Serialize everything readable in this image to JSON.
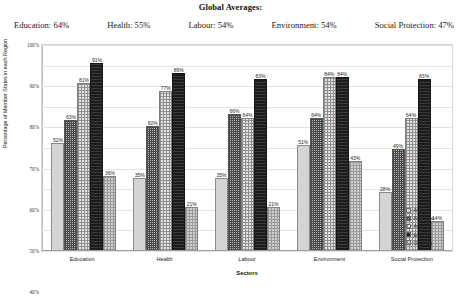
{
  "header": {
    "title": "Global Averages:",
    "averages": [
      {
        "label": "Education",
        "value": "64%",
        "text": "Education: 64%"
      },
      {
        "label": "Health",
        "value": "55%",
        "text": "Health: 55%"
      },
      {
        "label": "Labour",
        "value": "54%",
        "text": "Labour: 54%"
      },
      {
        "label": "Environment",
        "value": "54%",
        "text": "Environment: 54%"
      },
      {
        "label": "Social Protection",
        "value": "47%",
        "text": "Social Protection: 47%"
      }
    ]
  },
  "chart_data": {
    "type": "bar",
    "title": "Global Averages:",
    "xlabel": "Sectors",
    "ylabel": "Percentage of Member States in each Region",
    "ylim": [
      0,
      100
    ],
    "ytick_labels": [
      "100%",
      "90%",
      "80%",
      "70%",
      "60%",
      "50%",
      "40%",
      "30%",
      "20%",
      "10%",
      "0%"
    ],
    "ytick_values": [
      100,
      90,
      80,
      70,
      60,
      50,
      40,
      30,
      20,
      10,
      0
    ],
    "grid": true,
    "legend_position": "right",
    "categories": [
      "Education",
      "Health",
      "Labour",
      "Environment",
      "Social Protection"
    ],
    "series": [
      {
        "name": "Africa",
        "values": [
          52,
          35,
          35,
          51,
          28
        ],
        "labels": [
          "52%",
          "35%",
          "35%",
          "51%",
          "28%"
        ]
      },
      {
        "name": "Americas",
        "values": [
          63,
          60,
          66,
          64,
          49
        ],
        "labels": [
          "63%",
          "60%",
          "66%",
          "64%",
          "49%"
        ]
      },
      {
        "name": "Asia",
        "values": [
          81,
          77,
          64,
          84,
          64
        ],
        "labels": [
          "81%",
          "77%",
          "64%",
          "84%",
          "64%"
        ]
      },
      {
        "name": "Europe",
        "values": [
          91,
          86,
          83,
          84,
          83
        ],
        "labels": [
          "91%",
          "86%",
          "83%",
          "84%",
          "83%"
        ]
      },
      {
        "name": "Oceania",
        "values": [
          36,
          21,
          21,
          43,
          14
        ],
        "labels": [
          "36%",
          "21%",
          "21%",
          "43%",
          "14%"
        ]
      }
    ],
    "legend_entries": [
      "Africa",
      "Americas",
      "Asia",
      "Europe",
      "Oceania"
    ],
    "colors": {
      "Africa": "#d4d4d4",
      "Americas": "#b4b4b4",
      "Asia": "#e2e2e2",
      "Europe": "#242424",
      "Oceania": "#cfcfcf"
    }
  }
}
